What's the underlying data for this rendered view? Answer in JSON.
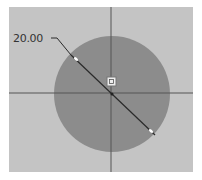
{
  "sketch": {
    "dimension": {
      "value": "20.00",
      "type": "diameter"
    },
    "colors": {
      "background": "#c4c4c4",
      "circle_fill": "#8c8c8c",
      "axis_line": "#555555",
      "dimension_line": "#2a2a2a"
    }
  }
}
